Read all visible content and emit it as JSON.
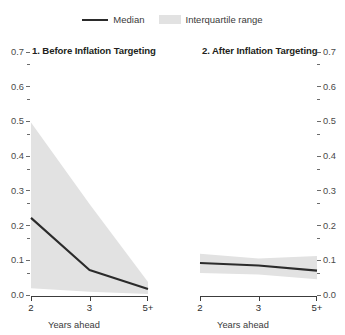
{
  "legend": {
    "median_label": "Median",
    "iqr_label": "Interquartile range"
  },
  "colors": {
    "median_line": "#2b2b2b",
    "iqr_band": "#e2e2e2",
    "axis": "#3c3c3c",
    "text": "#231f20",
    "background": "#ffffff"
  },
  "axis": {
    "x_title": "Years ahead",
    "x_ticks": [
      "2",
      "3",
      "5+"
    ],
    "y_ticks": [
      "0.0",
      "0.1",
      "0.2",
      "0.3",
      "0.4",
      "0.5",
      "0.6",
      "0.7"
    ],
    "y_min": 0.0,
    "y_max": 0.7
  },
  "panels": {
    "left_title": "1. Before Inflation Targeting",
    "right_title": "2. After Inflation Targeting"
  },
  "chart_data": [
    {
      "type": "line",
      "title": "1. Before Inflation Targeting",
      "xlabel": "Years ahead",
      "ylabel": "",
      "x": [
        "2",
        "3",
        "5+"
      ],
      "ylim": [
        0.0,
        0.7
      ],
      "yticks": [
        0.0,
        0.1,
        0.2,
        0.3,
        0.4,
        0.5,
        0.6,
        0.7
      ],
      "grid": false,
      "legend_position": "top-center",
      "series": [
        {
          "name": "Median",
          "values": [
            0.225,
            0.075,
            0.02
          ]
        },
        {
          "name": "Interquartile range upper",
          "values": [
            0.5,
            0.265,
            0.04
          ]
        },
        {
          "name": "Interquartile range lower",
          "values": [
            0.022,
            0.012,
            0.006
          ]
        }
      ]
    },
    {
      "type": "line",
      "title": "2. After Inflation Targeting",
      "xlabel": "Years ahead",
      "ylabel": "",
      "x": [
        "2",
        "3",
        "5+"
      ],
      "ylim": [
        0.0,
        0.7
      ],
      "yticks": [
        0.0,
        0.1,
        0.2,
        0.3,
        0.4,
        0.5,
        0.6,
        0.7
      ],
      "grid": false,
      "legend_position": "top-center",
      "series": [
        {
          "name": "Median",
          "values": [
            0.095,
            0.088,
            0.073
          ]
        },
        {
          "name": "Interquartile range upper",
          "values": [
            0.122,
            0.108,
            0.115
          ]
        },
        {
          "name": "Interquartile range lower",
          "values": [
            0.066,
            0.062,
            0.048
          ]
        }
      ]
    }
  ]
}
